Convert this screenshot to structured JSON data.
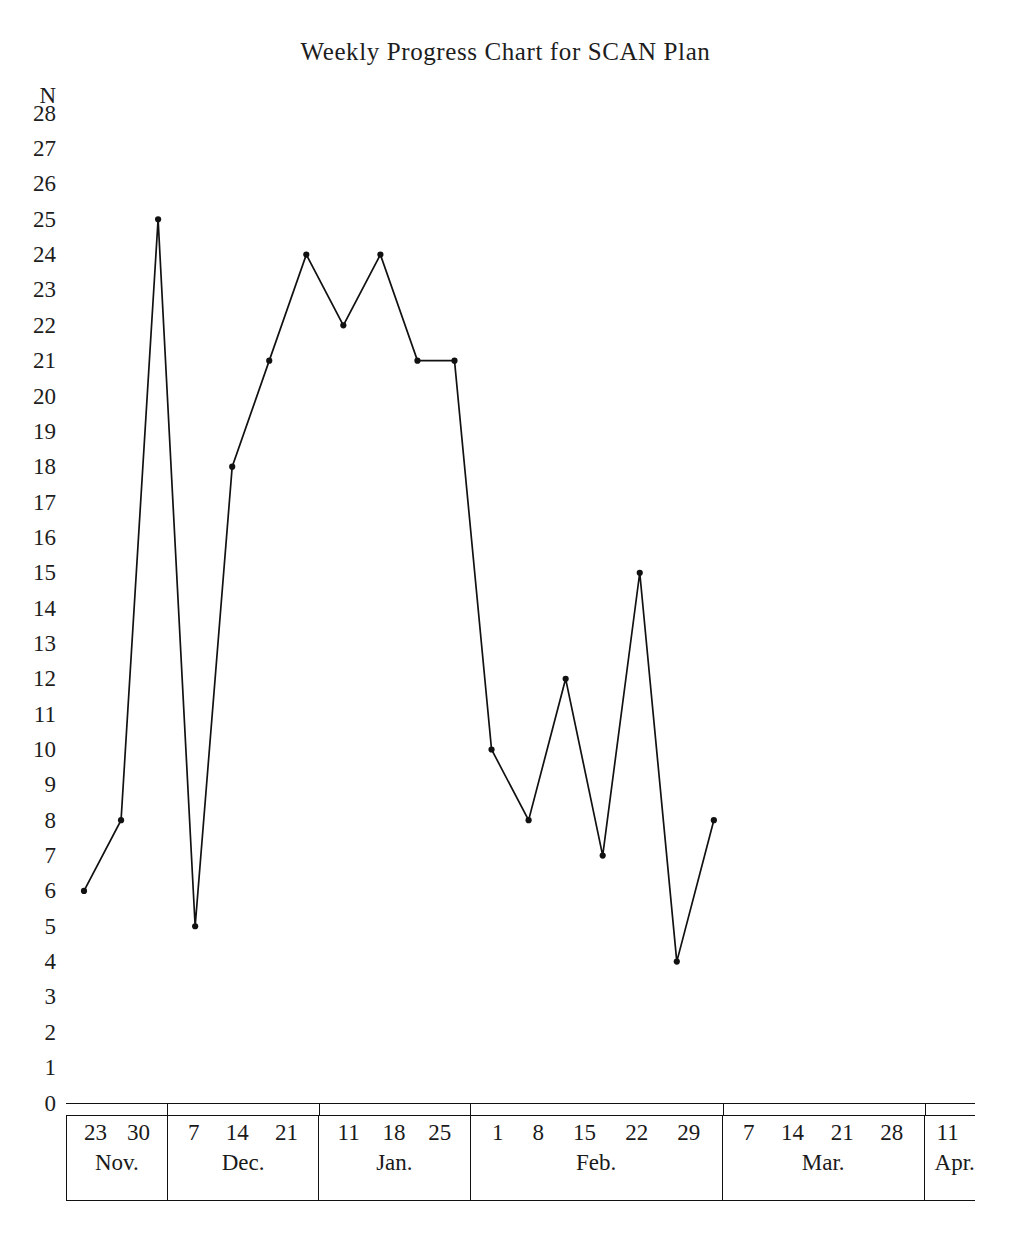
{
  "chart": {
    "title": "Weekly Progress Chart for SCAN Plan",
    "y_axis_name": "N"
  },
  "chart_data": {
    "type": "line",
    "title": "Weekly Progress Chart for SCAN Plan",
    "xlabel": "",
    "ylabel": "N",
    "ylim": [
      0,
      28
    ],
    "grid": false,
    "legend": "none",
    "marker": "filled-circle",
    "line_color": "#111111",
    "y_ticks": [
      28,
      27,
      26,
      25,
      24,
      23,
      22,
      21,
      20,
      19,
      18,
      17,
      16,
      15,
      14,
      13,
      12,
      11,
      10,
      9,
      8,
      7,
      6,
      5,
      4,
      3,
      2,
      1,
      0
    ],
    "categories": [
      "23 Nov.",
      "30 Nov.",
      "7 Dec.",
      "14 Dec.",
      "21 Dec.",
      "11 Jan.",
      "18 Jan.",
      "25 Jan.",
      "1 Feb.",
      "8 Feb.",
      "15 Feb.",
      "22 Feb.",
      "29 Feb.",
      "7 Mar.",
      "14 Mar.",
      "21 Mar.",
      "28 Mar.",
      "11 Apr."
    ],
    "values": [
      6,
      8,
      25,
      5,
      18,
      21,
      24,
      22,
      24,
      21,
      21,
      10,
      8,
      12,
      7,
      15,
      4,
      8
    ],
    "x_axis_groups": [
      {
        "month": "Nov.",
        "days": [
          "23",
          "30"
        ]
      },
      {
        "month": "Dec.",
        "days": [
          "7",
          "14",
          "21"
        ]
      },
      {
        "month": "Jan.",
        "days": [
          "11",
          "18",
          "25"
        ]
      },
      {
        "month": "Feb.",
        "days": [
          "1",
          "8",
          "15",
          "22",
          "29"
        ]
      },
      {
        "month": "Mar.",
        "days": [
          "7",
          "14",
          "21",
          "28"
        ]
      },
      {
        "month": "Apr.",
        "days": [
          "11"
        ]
      }
    ]
  }
}
